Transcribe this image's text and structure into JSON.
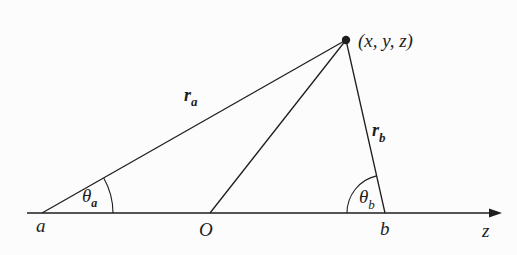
{
  "diagram": {
    "type": "geometry",
    "colors": {
      "background": "#fcfcfc",
      "ink": "#1e1e1e"
    },
    "axis": {
      "label": "z",
      "start": [
        27,
        213
      ],
      "end": [
        502,
        213
      ]
    },
    "points": {
      "field_point": {
        "label": "(x, y, z)",
        "pos": [
          346,
          40
        ]
      },
      "a": {
        "label": "a",
        "pos": [
          42,
          213
        ]
      },
      "origin": {
        "label": "O",
        "pos": [
          210,
          213
        ]
      },
      "b": {
        "label": "b",
        "pos": [
          385,
          213
        ]
      }
    },
    "distances": {
      "r_a": {
        "symbol": "r",
        "subscript": "a"
      },
      "r_b": {
        "symbol": "r",
        "subscript": "b"
      }
    },
    "angles": {
      "theta_a": {
        "symbol": "θ",
        "subscript": "a"
      },
      "theta_b": {
        "symbol": "θ",
        "subscript": "b"
      }
    }
  }
}
